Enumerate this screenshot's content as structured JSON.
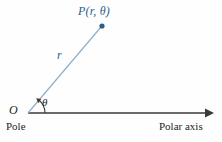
{
  "figure": {
    "background_color": "#fefefe",
    "width": 222,
    "height": 142
  },
  "colors": {
    "ray": "#7fa6c4",
    "point_marker": "#2f5e86",
    "point_label": "#2c5f8a",
    "axis": "#3a3a3a",
    "text": "#232323"
  },
  "labels": {
    "point": "P(r, θ)",
    "radius": "r",
    "angle": "θ",
    "origin": "O",
    "pole": "Pole",
    "polar_axis": "Polar axis"
  },
  "geometry": {
    "origin": {
      "x": 28,
      "y": 113
    },
    "point": {
      "x": 102,
      "y": 26
    },
    "axis_start": {
      "x": 28,
      "y": 113
    },
    "axis_end": {
      "x": 213,
      "y": 113
    },
    "angle_arc_radius": 17
  }
}
